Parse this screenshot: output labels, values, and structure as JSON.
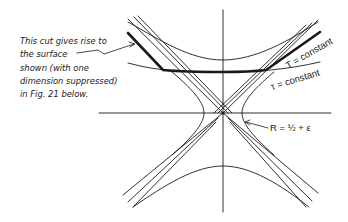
{
  "figure": {
    "annotation_lines": [
      "This cut gives rise to",
      "the surface",
      "shown (with one",
      "dimension suppressed)",
      "in Fig. 21 below."
    ],
    "labels": {
      "T_const": "T = constant",
      "tau_const": "τ = constant",
      "R_const": "R = ½ + ε"
    },
    "colors": {
      "ink": "#1a1a1a",
      "background": "#ffffff"
    }
  }
}
